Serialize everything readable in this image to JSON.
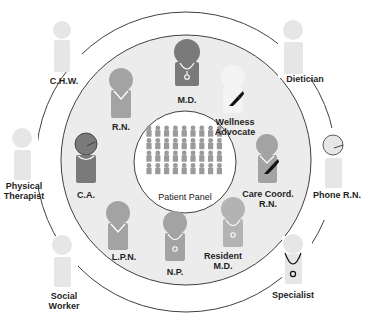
{
  "diagram": {
    "colors": {
      "background": "#ffffff",
      "inner_fill": "#ececec",
      "ring_stroke": "#2a2a2a",
      "core_dark": "#7a7a7a",
      "core_mid": "#a3a3a3",
      "extended_faint": "#e6e6e6",
      "wellness_faint": "#f2f2f2",
      "patient_icon": "#9a9a9a"
    },
    "center": {
      "label": "Patient Panel",
      "rows": 4,
      "cols": 9
    },
    "core_team": [
      {
        "id": "md",
        "label": "M.D."
      },
      {
        "id": "rn",
        "label": "R.N."
      },
      {
        "id": "wellness",
        "label_line1": "Wellness",
        "label_line2": "Advocate"
      },
      {
        "id": "ca",
        "label": "C.A."
      },
      {
        "id": "carecoord",
        "label_line1": "Care Coord.",
        "label_line2": "R.N."
      },
      {
        "id": "lpn",
        "label": "L.P.N."
      },
      {
        "id": "np",
        "label": "N.P."
      },
      {
        "id": "resident",
        "label_line1": "Resident",
        "label_line2": "M.D."
      }
    ],
    "extended_team": [
      {
        "id": "chw",
        "label": "C.H.W."
      },
      {
        "id": "dietician",
        "label": "Dietician"
      },
      {
        "id": "pt",
        "label_line1": "Physical",
        "label_line2": "Therapist"
      },
      {
        "id": "phone-rn",
        "label": "Phone R.N."
      },
      {
        "id": "social",
        "label_line1": "Social",
        "label_line2": "Worker"
      },
      {
        "id": "specialist",
        "label": "Specialist"
      }
    ]
  }
}
